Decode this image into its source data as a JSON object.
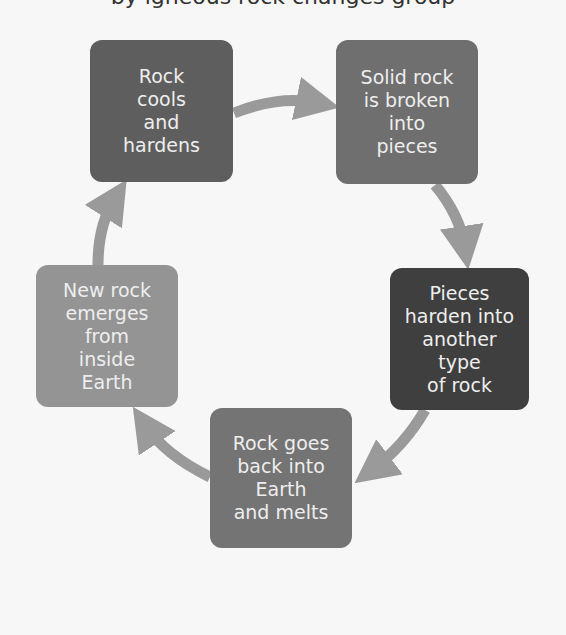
{
  "title_fragment": "by igneous rock changes group",
  "boxes": [
    {
      "id": "rock-cools",
      "text": "Rock\ncools\nand\nhardens",
      "color": "#5e5e5e",
      "x": 90,
      "y": 40,
      "w": 143,
      "h": 142
    },
    {
      "id": "solid-rock-broken",
      "text": "Solid rock\nis broken\ninto\npieces",
      "color": "#6f6f6f",
      "x": 336,
      "y": 40,
      "w": 142,
      "h": 144
    },
    {
      "id": "pieces-harden",
      "text": "Pieces\nharden into\nanother\ntype\nof rock",
      "color": "#3f3f3f",
      "x": 390,
      "y": 268,
      "w": 139,
      "h": 142
    },
    {
      "id": "rock-goes-back",
      "text": "Rock goes\nback into\nEarth\nand melts",
      "color": "#747474",
      "x": 210,
      "y": 408,
      "w": 142,
      "h": 140
    },
    {
      "id": "new-rock-emerges",
      "text": "New rock\nemerges\nfrom\ninside\nEarth",
      "color": "#949494",
      "x": 36,
      "y": 265,
      "w": 142,
      "h": 142
    }
  ],
  "arrow_color": "#9a9a9a"
}
